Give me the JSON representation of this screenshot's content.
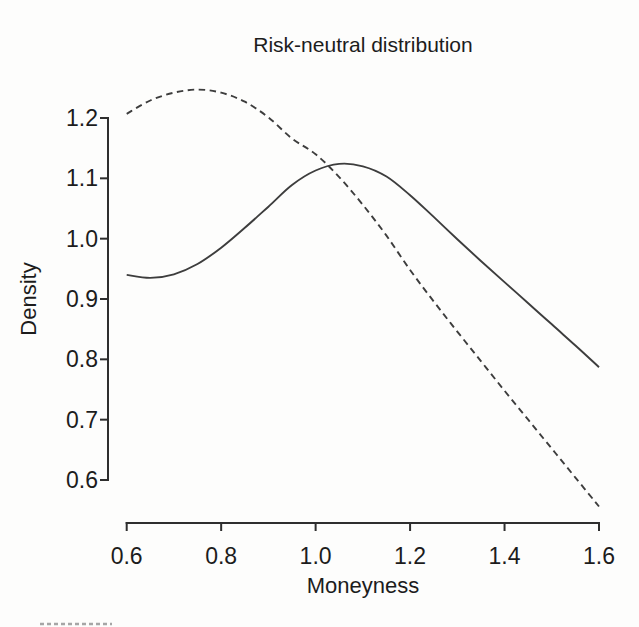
{
  "window": {
    "width": 639,
    "height": 627,
    "background": "#fdfdfc"
  },
  "colors": {
    "line": "#3d3d3d",
    "axis": "#2e2e2e",
    "text": "#1c1c1c",
    "artifact": "#8a8a8a"
  },
  "chart_data": {
    "type": "line",
    "title": "Risk-neutral distribution",
    "xlabel": "Moneyness",
    "ylabel": "Density",
    "grid": false,
    "legend": "none",
    "xlim": [
      0.6,
      1.6
    ],
    "ylim": [
      0.54,
      1.27
    ],
    "x_tick_values": [
      0.6,
      0.8,
      1.0,
      1.2,
      1.4,
      1.6
    ],
    "x_tick_labels": [
      "0.6",
      "0.8",
      "1.0",
      "1.2",
      "1.4",
      "1.6"
    ],
    "y_tick_values": [
      0.6,
      0.7,
      0.8,
      0.9,
      1.0,
      1.1,
      1.2
    ],
    "y_tick_labels": [
      "0.6",
      "0.7",
      "0.8",
      "0.9",
      "1.0",
      "1.1",
      "1.2"
    ],
    "x": [
      0.6,
      0.65,
      0.7,
      0.75,
      0.8,
      0.85,
      0.9,
      0.95,
      1.0,
      1.05,
      1.1,
      1.15,
      1.2,
      1.25,
      1.3,
      1.35,
      1.4,
      1.45,
      1.5,
      1.55,
      1.6
    ],
    "series": [
      {
        "name": "density-curve-solid",
        "line_style": "solid",
        "values": [
          0.94,
          0.935,
          0.941,
          0.958,
          0.985,
          1.018,
          1.053,
          1.089,
          1.113,
          1.124,
          1.12,
          1.103,
          1.072,
          1.036,
          0.999,
          0.963,
          0.928,
          0.893,
          0.858,
          0.823,
          0.787
        ]
      },
      {
        "name": "density-curve-dashed",
        "line_style": "dashed",
        "values": [
          1.207,
          1.229,
          1.242,
          1.247,
          1.242,
          1.227,
          1.201,
          1.166,
          1.14,
          1.102,
          1.056,
          1.005,
          0.948,
          0.896,
          0.846,
          0.797,
          0.748,
          0.7,
          0.652,
          0.604,
          0.556
        ]
      }
    ]
  }
}
